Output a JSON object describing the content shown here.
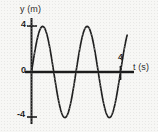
{
  "figure": {
    "background_color": "#f7f7f5",
    "ink_color": "#1c1c1c"
  },
  "chart_data": {
    "type": "line",
    "title": "",
    "subtitle": "",
    "xlabel": "t (s)",
    "ylabel": "y (m)",
    "xlim": [
      0,
      4.3
    ],
    "ylim": [
      -5,
      5
    ],
    "grid": false,
    "legend": null,
    "annotations": [],
    "x_ticks": [
      {
        "value": 4,
        "label": "4"
      }
    ],
    "y_ticks": [
      {
        "value": 4,
        "label": "4"
      },
      {
        "value": 0,
        "label": "0"
      },
      {
        "value": -4,
        "label": "-4"
      }
    ],
    "series": [
      {
        "name": "y = 4 sin(pi t)",
        "amplitude": 4,
        "period": 2,
        "phase": 0,
        "x": [
          0,
          0.1,
          0.2,
          0.3,
          0.4,
          0.5,
          0.6,
          0.7,
          0.8,
          0.9,
          1.0,
          1.1,
          1.2,
          1.3,
          1.4,
          1.5,
          1.6,
          1.7,
          1.8,
          1.9,
          2.0,
          2.1,
          2.2,
          2.3,
          2.4,
          2.5,
          2.6,
          2.7,
          2.8,
          2.9,
          3.0,
          3.1,
          3.2,
          3.3,
          3.4,
          3.5,
          3.6,
          3.7,
          3.8,
          3.9,
          4.0,
          4.1,
          4.2,
          4.3
        ],
        "values": [
          0.0,
          1.24,
          2.35,
          3.24,
          3.8,
          4.0,
          3.8,
          3.24,
          2.35,
          1.24,
          0.0,
          -1.24,
          -2.35,
          -3.24,
          -3.8,
          -4.0,
          -3.8,
          -3.24,
          -2.35,
          -1.24,
          0.0,
          1.24,
          2.35,
          3.24,
          3.8,
          4.0,
          3.8,
          3.24,
          2.35,
          1.24,
          0.0,
          -1.24,
          -2.35,
          -3.24,
          -3.8,
          -4.0,
          -3.8,
          -3.24,
          -2.35,
          -1.24,
          0.0,
          1.24,
          2.35,
          3.24
        ]
      }
    ],
    "zero_crossings": [
      0,
      1,
      2,
      3,
      4
    ],
    "maxima": [
      {
        "x": 0.5,
        "y": 4
      },
      {
        "x": 2.5,
        "y": 4
      }
    ],
    "minima": [
      {
        "x": 1.5,
        "y": -4
      },
      {
        "x": 3.5,
        "y": -4
      }
    ]
  },
  "labels": {
    "y_axis": "y (m)",
    "t_axis": "t (s)",
    "tick_y_positive": "4",
    "tick_y_zero": "0",
    "tick_y_negative": "-4",
    "tick_t_four": "4"
  }
}
